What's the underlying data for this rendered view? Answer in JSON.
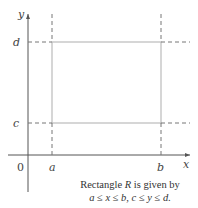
{
  "diagram": {
    "axes": {
      "x_label": "x",
      "y_label": "y",
      "origin_label": "0"
    },
    "rectangle": {
      "name": "R",
      "x_labels": {
        "left": "a",
        "right": "b"
      },
      "y_labels": {
        "bottom": "c",
        "top": "d"
      }
    },
    "caption": {
      "line1_prefix": "Rectangle ",
      "line1_var": "R",
      "line1_suffix": " is given by",
      "line2": "a ≤ x ≤ b, c ≤ y ≤ d."
    },
    "colors": {
      "axis": "#555555",
      "rectangle": "#bbbbbb",
      "dashes": "#777777",
      "text": "#444444"
    }
  }
}
